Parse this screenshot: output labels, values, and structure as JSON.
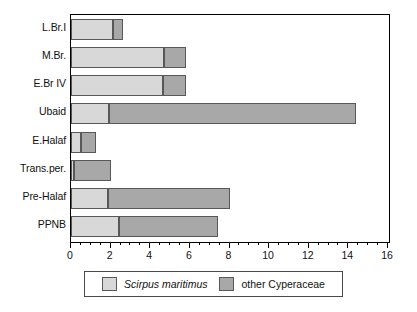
{
  "chart_data": {
    "type": "bar",
    "orientation": "horizontal",
    "stacked": true,
    "title": "",
    "xlabel": "",
    "ylabel": "",
    "xlim": [
      0,
      16
    ],
    "xticks": [
      0,
      2,
      4,
      6,
      8,
      10,
      12,
      14,
      16
    ],
    "xtick_labels": [
      "0",
      "2",
      "4",
      "6",
      "8",
      "10",
      "12",
      "14",
      "16"
    ],
    "minor_tick_step": 0.5,
    "grid": false,
    "legend_position": "bottom",
    "categories": [
      "L.Br.I",
      "M.Br.",
      "E.Br IV",
      "Ubaid",
      "E.Halaf",
      "Trans.per.",
      "Pre-Halaf",
      "PPNB"
    ],
    "series": [
      {
        "name": "Scirpus maritimus",
        "color": "#d8d8d8",
        "italic_label": true,
        "values": [
          2.1,
          4.7,
          4.65,
          1.9,
          0.5,
          0.15,
          1.85,
          2.4
        ]
      },
      {
        "name": "other Cyperaceae",
        "color": "#a8a8a8",
        "italic_label": false,
        "values": [
          0.5,
          1.1,
          1.15,
          12.5,
          0.75,
          1.85,
          6.2,
          5.0
        ]
      }
    ],
    "totals": [
      2.6,
      5.8,
      5.8,
      14.4,
      1.25,
      2.0,
      8.05,
      7.4
    ]
  },
  "legend": {
    "entries": [
      {
        "label": "Scirpus maritimus",
        "swatch": "#d8d8d8",
        "italic": true
      },
      {
        "label": "other Cyperaceae",
        "swatch": "#a8a8a8",
        "italic": false
      }
    ]
  },
  "colors": {
    "light_gray": "#d8d8d8",
    "dark_gray": "#a8a8a8",
    "frame": "#000000",
    "bar_border": "#585858",
    "background": "#ffffff",
    "text": "#111111"
  }
}
